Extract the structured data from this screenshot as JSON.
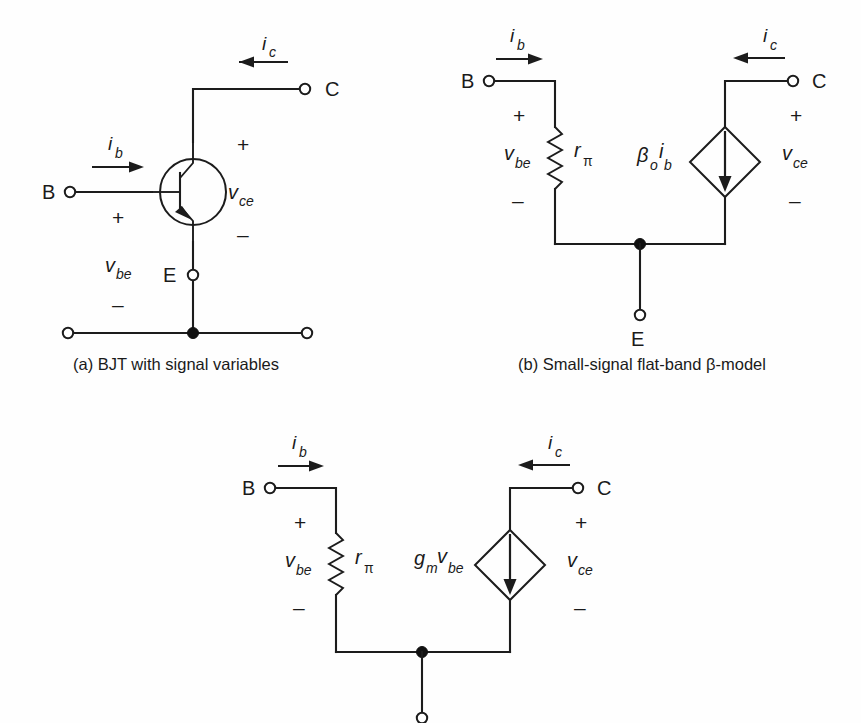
{
  "figure": {
    "background_color": "#fefefe",
    "ink_color": "#1c1c1c",
    "width": 861,
    "height": 723,
    "panel_count": 3
  },
  "panels": [
    {
      "id": "a",
      "caption": "(a) BJT with signal variables",
      "device": "npn-bjt",
      "terminals": [
        {
          "name": "B",
          "label": "B",
          "type": "open"
        },
        {
          "name": "C",
          "label": "C",
          "type": "open"
        },
        {
          "name": "E",
          "label": "E",
          "type": "open"
        },
        {
          "name": "bottom-left",
          "label": "",
          "type": "open"
        },
        {
          "name": "bottom-right",
          "label": "",
          "type": "open"
        }
      ],
      "currents": [
        {
          "name": "ib",
          "symbol": "i",
          "subscript": "b",
          "direction": "right"
        },
        {
          "name": "ic",
          "symbol": "i",
          "subscript": "c",
          "direction": "left"
        }
      ],
      "voltages": [
        {
          "name": "vbe",
          "symbol": "v",
          "subscript": "be",
          "plus": "+",
          "minus": "–"
        },
        {
          "name": "vce",
          "symbol": "v",
          "subscript": "ce",
          "plus": "+",
          "minus": "–"
        }
      ]
    },
    {
      "id": "b",
      "caption": "(b) Small-signal flat-band β-model",
      "device": "small-signal-beta-model",
      "terminals": [
        {
          "name": "B",
          "label": "B",
          "type": "open"
        },
        {
          "name": "C",
          "label": "C",
          "type": "open"
        },
        {
          "name": "E",
          "label": "E",
          "type": "open"
        }
      ],
      "components": [
        {
          "name": "r-pi-resistor",
          "symbol": "r",
          "subscript": "π",
          "kind": "resistor"
        },
        {
          "name": "beta-ib-source",
          "symbol": "β",
          "subscript": "o",
          "symbol2": "i",
          "subscript2": "b",
          "kind": "dependent-current-source",
          "arrow": "down"
        }
      ],
      "currents": [
        {
          "name": "ib",
          "symbol": "i",
          "subscript": "b",
          "direction": "right"
        },
        {
          "name": "ic",
          "symbol": "i",
          "subscript": "c",
          "direction": "left"
        }
      ],
      "voltages": [
        {
          "name": "vbe",
          "symbol": "v",
          "subscript": "be",
          "plus": "+",
          "minus": "–"
        },
        {
          "name": "vce",
          "symbol": "v",
          "subscript": "ce",
          "plus": "+",
          "minus": "–"
        }
      ]
    },
    {
      "id": "c",
      "caption": "",
      "device": "small-signal-hybrid-pi-model",
      "terminals": [
        {
          "name": "B",
          "label": "B",
          "type": "open"
        },
        {
          "name": "C",
          "label": "C",
          "type": "open"
        },
        {
          "name": "E",
          "label": "",
          "type": "open"
        }
      ],
      "components": [
        {
          "name": "r-pi-resistor",
          "symbol": "r",
          "subscript": "π",
          "kind": "resistor"
        },
        {
          "name": "gm-vbe-source",
          "symbol": "g",
          "subscript": "m",
          "symbol2": "v",
          "subscript2": "be",
          "kind": "dependent-current-source",
          "arrow": "down"
        }
      ],
      "currents": [
        {
          "name": "ib",
          "symbol": "i",
          "subscript": "b",
          "direction": "right"
        },
        {
          "name": "ic",
          "symbol": "i",
          "subscript": "c",
          "direction": "left"
        }
      ],
      "voltages": [
        {
          "name": "vbe",
          "symbol": "v",
          "subscript": "be",
          "plus": "+",
          "minus": "–"
        },
        {
          "name": "vce",
          "symbol": "v",
          "subscript": "ce",
          "plus": "+",
          "minus": "–"
        }
      ]
    }
  ],
  "text": {
    "panel_a": {
      "caption": "(a) BJT with signal variables",
      "node_b": "B",
      "node_c": "C",
      "node_e": "E",
      "ib_sym": "i",
      "ib_sub": "b",
      "ic_sym": "i",
      "ic_sub": "c",
      "vbe_sym": "v",
      "vbe_sub": "be",
      "vce_sym": "v",
      "vce_sub": "ce",
      "plus_be": "+",
      "minus_be": "–",
      "plus_ce": "+",
      "minus_ce": "–"
    },
    "panel_b": {
      "caption": "(b) Small-signal flat-band β-model",
      "node_b": "B",
      "node_c": "C",
      "node_e": "E",
      "ib_sym": "i",
      "ib_sub": "b",
      "ic_sym": "i",
      "ic_sub": "c",
      "vbe_sym": "v",
      "vbe_sub": "be",
      "vce_sym": "v",
      "vce_sub": "ce",
      "plus_be": "+",
      "minus_be": "–",
      "plus_ce": "+",
      "minus_ce": "–",
      "r_sym": "r",
      "r_sub": "π",
      "src_sym": "β",
      "src_sub": "o",
      "src_sym2": "i",
      "src_sub2": "b"
    },
    "panel_c": {
      "node_b": "B",
      "node_c": "C",
      "ib_sym": "i",
      "ib_sub": "b",
      "ic_sym": "i",
      "ic_sub": "c",
      "vbe_sym": "v",
      "vbe_sub": "be",
      "vce_sym": "v",
      "vce_sub": "ce",
      "plus_be": "+",
      "minus_be": "–",
      "plus_ce": "+",
      "minus_ce": "–",
      "r_sym": "r",
      "r_sub": "π",
      "src_sym": "g",
      "src_sub": "m",
      "src_sym2": "v",
      "src_sub2": "be"
    }
  }
}
